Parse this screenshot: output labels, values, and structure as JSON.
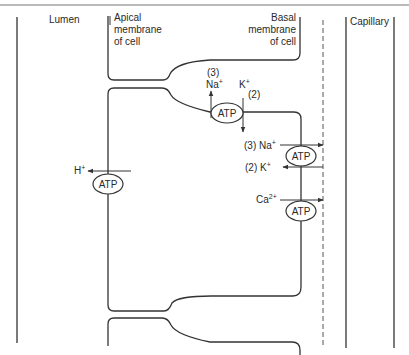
{
  "diagram": {
    "regions": {
      "lumen": "Lumen",
      "apical_line1": "Apical",
      "apical_line2": "membrane",
      "apical_line3": "of cell",
      "basal_line1": "Basal",
      "basal_line2": "membrane",
      "basal_line3": "of cell",
      "capillary": "Capillary"
    },
    "pumps": [
      {
        "id": "na-k-pump-top",
        "label": "ATP",
        "ions": [
          {
            "ion": "Na+",
            "stoich": "(3)",
            "direction": "up"
          },
          {
            "ion": "K+",
            "stoich": "(2)",
            "direction": "down"
          }
        ]
      },
      {
        "id": "h-pump-apical",
        "label": "ATP",
        "ions": [
          {
            "ion": "H+",
            "direction": "left (to lumen)"
          }
        ]
      },
      {
        "id": "na-k-pump-basal",
        "label": "ATP",
        "ions": [
          {
            "ion": "Na+",
            "stoich": "(3)",
            "direction": "right (to capillary)"
          },
          {
            "ion": "K+",
            "stoich": "(2)",
            "direction": "left (into cell)"
          }
        ]
      },
      {
        "id": "ca-pump-basal",
        "label": "ATP",
        "ions": [
          {
            "ion": "Ca2+",
            "direction": "right (to capillary)"
          }
        ]
      }
    ],
    "labels": {
      "atp": "ATP",
      "na3": "(3)",
      "na": "Na",
      "plus": "+",
      "k": "K",
      "k2": "(2)",
      "basal_na": "(3) Na",
      "basal_k": "(2)  K",
      "h": "H",
      "ca": "Ca",
      "ca_charge": "2+"
    }
  }
}
